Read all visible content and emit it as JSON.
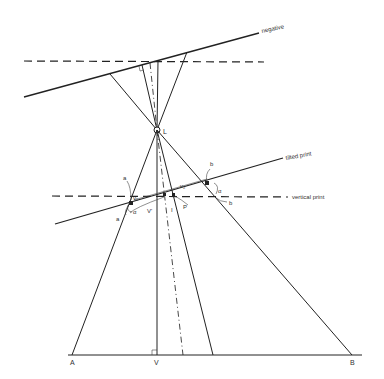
{
  "labels": {
    "negative": "negative",
    "tilted_print": "tilted print",
    "vertical_print": "vertical print",
    "lens": "L",
    "point_a_upper": "a",
    "point_a_lower": "a",
    "point_b_upper": "b",
    "point_b_lower": "b",
    "v_prime": "V'",
    "p": "P",
    "i": "I",
    "v1": "v₁",
    "v2": "v₂",
    "alpha1": "α",
    "alpha2": "α",
    "ground_a": "A",
    "ground_v": "V",
    "ground_b": "B"
  },
  "colors": {
    "line": "#222222",
    "background": "#ffffff"
  }
}
